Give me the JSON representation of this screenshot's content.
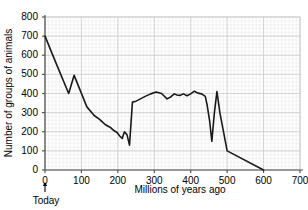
{
  "chart_data": {
    "type": "line",
    "title": "",
    "xlabel": "Millions of years ago",
    "ylabel": "Number of groups of animals",
    "xlim": [
      0,
      700
    ],
    "ylim": [
      0,
      800
    ],
    "grid": true,
    "grid_minor": true,
    "legend": "none",
    "line_color": "#1a1a1a",
    "grid_color": "#cccccc",
    "grid_minor_color": "#e6e6e6",
    "axis_color": "#555555",
    "xticks": [
      0,
      100,
      200,
      300,
      400,
      500,
      600,
      700
    ],
    "yticks": [
      0,
      100,
      200,
      300,
      400,
      500,
      600,
      700,
      800
    ],
    "xtick_labels": [
      "0",
      "100",
      "200",
      "300",
      "400",
      "500",
      "600",
      "700"
    ],
    "ytick_labels": [
      "0",
      "100",
      "200",
      "300",
      "400",
      "500",
      "600",
      "700",
      "800"
    ],
    "annotations": [
      {
        "name": "today-marker",
        "text": "Today",
        "x": 0,
        "arrow": "up"
      }
    ],
    "series": [
      {
        "name": "groups of animals",
        "x": [
          0,
          30,
          65,
          80,
          115,
          135,
          150,
          158,
          165,
          172,
          180,
          190,
          198,
          205,
          212,
          218,
          225,
          232,
          240,
          250,
          262,
          275,
          290,
          305,
          320,
          335,
          345,
          355,
          362,
          370,
          380,
          390,
          400,
          410,
          420,
          430,
          440,
          445,
          452,
          458,
          465,
          472,
          480,
          500,
          600
        ],
        "y": [
          700,
          560,
          400,
          495,
          330,
          285,
          265,
          250,
          238,
          230,
          222,
          205,
          196,
          178,
          165,
          200,
          185,
          130,
          355,
          360,
          372,
          385,
          398,
          408,
          400,
          372,
          382,
          398,
          392,
          390,
          398,
          388,
          398,
          412,
          402,
          398,
          385,
          340,
          255,
          150,
          300,
          410,
          300,
          100,
          0
        ]
      }
    ]
  },
  "layout": {
    "plot_left": 45,
    "plot_right": 300,
    "plot_top": 17,
    "plot_bottom": 170
  }
}
